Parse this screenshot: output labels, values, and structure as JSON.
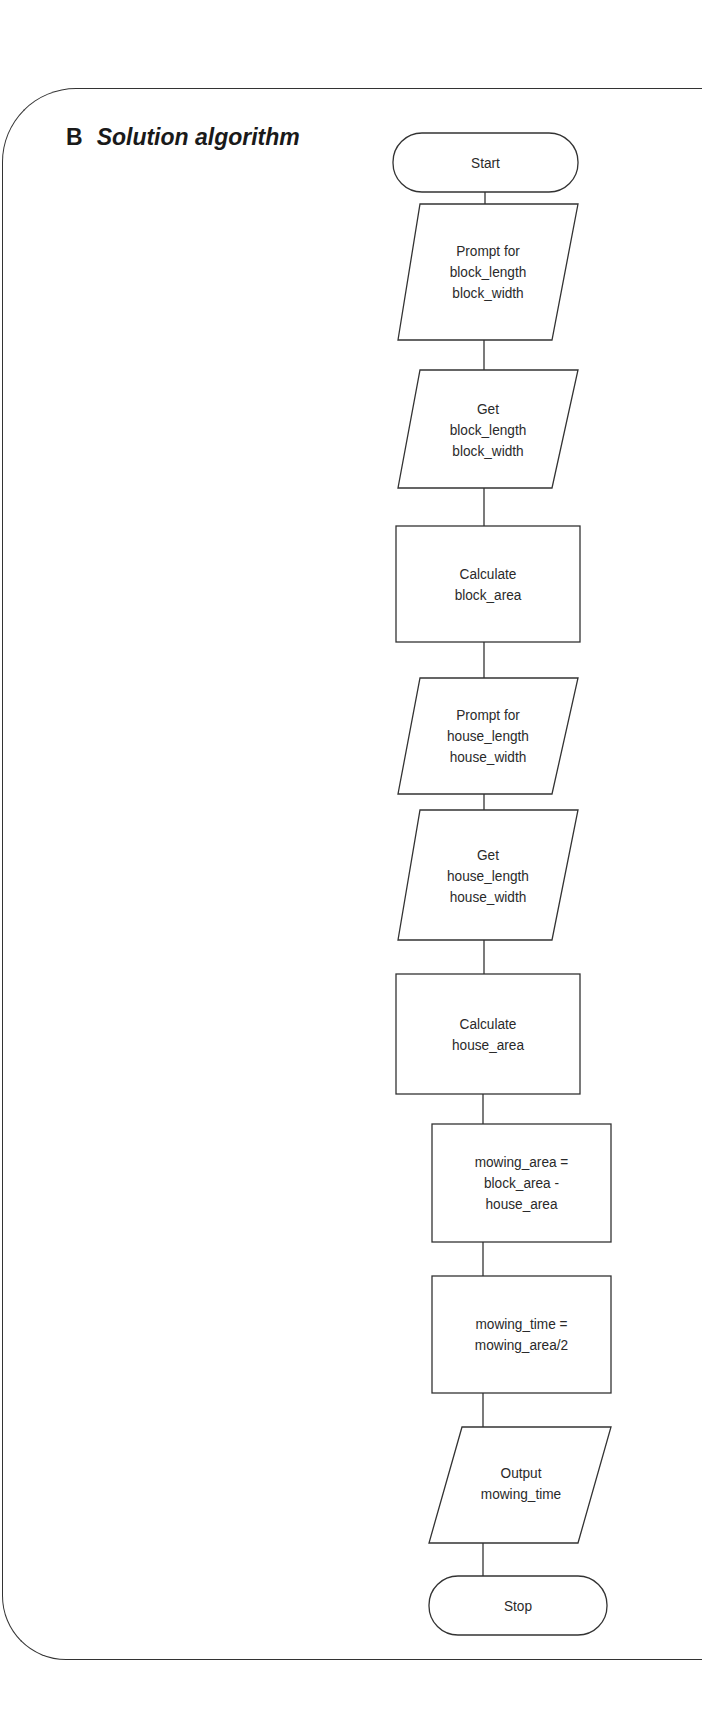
{
  "heading": {
    "letter": "B",
    "title": "Solution algorithm"
  },
  "flowchart": {
    "nodes": [
      {
        "id": "start",
        "shape": "terminator",
        "lines": [
          "Start"
        ]
      },
      {
        "id": "prompt_block",
        "shape": "input-output",
        "lines": [
          "Prompt for",
          "block_length",
          "block_width"
        ]
      },
      {
        "id": "get_block",
        "shape": "input-output",
        "lines": [
          "Get",
          "block_length",
          "block_width"
        ]
      },
      {
        "id": "calc_block_area",
        "shape": "process",
        "lines": [
          "Calculate",
          "block_area"
        ]
      },
      {
        "id": "prompt_house",
        "shape": "input-output",
        "lines": [
          "Prompt for",
          "house_length",
          "house_width"
        ]
      },
      {
        "id": "get_house",
        "shape": "input-output",
        "lines": [
          "Get",
          "house_length",
          "house_width"
        ]
      },
      {
        "id": "calc_house_area",
        "shape": "process",
        "lines": [
          "Calculate",
          "house_area"
        ]
      },
      {
        "id": "calc_mowing_area",
        "shape": "process",
        "lines": [
          "mowing_area =",
          "block_area -",
          "house_area"
        ]
      },
      {
        "id": "calc_mowing_time",
        "shape": "process",
        "lines": [
          "mowing_time =",
          "mowing_area/2"
        ]
      },
      {
        "id": "output_time",
        "shape": "input-output",
        "lines": [
          "Output",
          "mowing_time"
        ]
      },
      {
        "id": "stop",
        "shape": "terminator",
        "lines": [
          "Stop"
        ]
      }
    ]
  }
}
